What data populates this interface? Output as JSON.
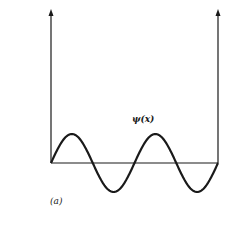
{
  "figure": {
    "wavefunction_label": "ψ(x)",
    "panel_label": "(a)",
    "colors": {
      "line": "#1a1a1a",
      "background": "#ffffff"
    }
  },
  "diagram": {
    "elements": [
      {
        "type": "wall",
        "name": "left-wall",
        "arrow": "up"
      },
      {
        "type": "wall",
        "name": "right-wall",
        "arrow": "up"
      },
      {
        "type": "axis",
        "name": "baseline-x-axis"
      },
      {
        "type": "curve",
        "name": "wavefunction",
        "shape": "sine",
        "half_wavelengths": 4,
        "starts_with": "positive"
      }
    ]
  }
}
